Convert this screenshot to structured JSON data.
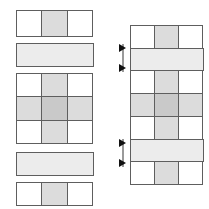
{
  "figure": {
    "background_color": "#ffffff",
    "stroke_color": "#5e5e5e",
    "arrow_color": "#111111",
    "guide_color": "#9a9a9a"
  },
  "palette": {
    "white": "#ffffff",
    "light": "#ececec",
    "mid": "#dcdcdc",
    "dark": "#c9c9c9"
  },
  "left_panel": {
    "label": "exploded pieces",
    "pieces": [
      {
        "id": "piece-top-strip",
        "label": "top strip",
        "rows": 1,
        "columns": 3,
        "cells": [
          [
            "white",
            "mid",
            "white"
          ]
        ]
      },
      {
        "id": "piece-upper-band",
        "label": "upper wide band",
        "rows": 1,
        "columns": 1,
        "cells": [
          [
            "light"
          ]
        ]
      },
      {
        "id": "piece-center-block",
        "label": "center block",
        "rows": 3,
        "columns": 3,
        "cells": [
          [
            "white",
            "mid",
            "white"
          ],
          [
            "mid",
            "dark",
            "mid"
          ],
          [
            "white",
            "mid",
            "white"
          ]
        ]
      },
      {
        "id": "piece-lower-band",
        "label": "lower wide band",
        "rows": 1,
        "columns": 1,
        "cells": [
          [
            "light"
          ]
        ]
      },
      {
        "id": "piece-bottom-strip",
        "label": "bottom strip",
        "rows": 1,
        "columns": 3,
        "cells": [
          [
            "white",
            "mid",
            "white"
          ]
        ]
      }
    ]
  },
  "right_panel": {
    "label": "assembled stack",
    "rows": [
      {
        "id": "row-1",
        "label": "top strip",
        "columns": 3,
        "cells": [
          "white",
          "mid",
          "white"
        ]
      },
      {
        "id": "row-2",
        "label": "upper wide band",
        "columns": 1,
        "cells": [
          "light"
        ]
      },
      {
        "id": "row-3",
        "label": "block row 1",
        "columns": 3,
        "cells": [
          "white",
          "mid",
          "white"
        ]
      },
      {
        "id": "row-4",
        "label": "block row 2",
        "columns": 3,
        "cells": [
          "mid",
          "dark",
          "mid"
        ]
      },
      {
        "id": "row-5",
        "label": "block row 3",
        "columns": 3,
        "cells": [
          "white",
          "mid",
          "white"
        ]
      },
      {
        "id": "row-6",
        "label": "lower wide band",
        "columns": 1,
        "cells": [
          "light"
        ]
      },
      {
        "id": "row-7",
        "label": "bottom strip",
        "columns": 3,
        "cells": [
          "white",
          "mid",
          "white"
        ]
      }
    ],
    "markers": [
      {
        "id": "marker-upper",
        "label": "insertion marker for upper band",
        "arrows": 2,
        "direction": "right"
      },
      {
        "id": "marker-lower",
        "label": "insertion marker for lower band",
        "arrows": 2,
        "direction": "right"
      }
    ]
  }
}
